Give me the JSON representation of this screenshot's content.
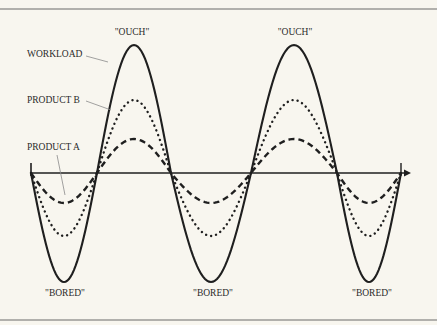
{
  "diagram": {
    "type": "wave-comparison",
    "series": [
      {
        "name": "WORKLOAD",
        "style": "solid",
        "label": "WORKLOAD"
      },
      {
        "name": "PRODUCT B",
        "style": "dotted",
        "label": "PRODUCT B"
      },
      {
        "name": "PRODUCT A",
        "style": "dashed",
        "label": "PRODUCT A"
      }
    ],
    "annotations": {
      "peak_label": "\"OUCH\"",
      "trough_label": "\"BORED\"",
      "peaks": [
        "\"OUCH\"",
        "\"OUCH\""
      ],
      "troughs": [
        "\"BORED\"",
        "\"BORED\"",
        "\"BORED\""
      ]
    },
    "colors": {
      "background": "#f8f6ef",
      "ink": "#1f1f1f",
      "leader": "#8a8a8a",
      "rule": "#6a6a6a"
    }
  }
}
